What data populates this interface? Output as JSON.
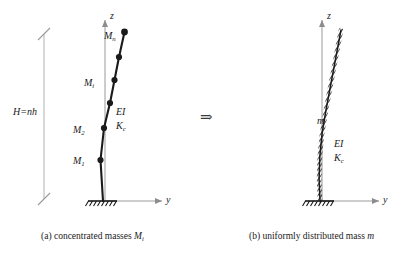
{
  "figure": {
    "background": "#ffffff",
    "ink": "#1a1a1a",
    "axis_color": "#8c8c8c",
    "transform_symbol": "⇒"
  },
  "panel_a": {
    "caption_prefix": "(a) concentrated masses ",
    "caption_symbol": "M",
    "caption_subscript": "i",
    "axis_z": "z",
    "axis_y": "y",
    "dimension": {
      "label_main": "H=nh",
      "label_plain": "H=nh"
    },
    "masses": [
      {
        "name": "mass-label-m1",
        "symbol": "M",
        "subscript": "1",
        "x": 73,
        "y": 156
      },
      {
        "name": "mass-label-m2",
        "symbol": "M",
        "subscript": "2",
        "x": 73,
        "y": 125
      },
      {
        "name": "mass-label-mi",
        "symbol": "M",
        "subscript": "i",
        "x": 84,
        "y": 78
      },
      {
        "name": "mass-label-mn",
        "symbol": "M",
        "subscript": "n",
        "x": 104,
        "y": 31
      }
    ],
    "properties": [
      {
        "name": "stiffness-label-ei",
        "symbol": "EI",
        "subscript": "",
        "x": 116,
        "y": 107
      },
      {
        "name": "stiffness-label-kc",
        "symbol": "K",
        "subscript": "c",
        "x": 116,
        "y": 120
      }
    ]
  },
  "panel_b": {
    "caption_prefix": "(b) uniformly distributed mass ",
    "caption_symbol": "m",
    "caption_subscript": "",
    "axis_z": "z",
    "axis_y": "y",
    "mass_label": {
      "name": "distributed-mass-label",
      "symbol": "m",
      "subscript": "",
      "x": 317,
      "y": 116
    },
    "properties": [
      {
        "name": "stiffness-label-ei",
        "symbol": "EI",
        "subscript": "",
        "x": 334,
        "y": 139
      },
      {
        "name": "stiffness-label-kc",
        "symbol": "K",
        "subscript": "c",
        "x": 334,
        "y": 152
      }
    ]
  }
}
